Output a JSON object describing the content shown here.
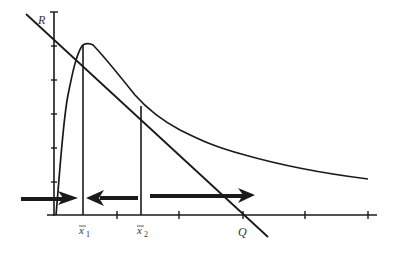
{
  "diagram": {
    "title": "",
    "axis_y_label": "R",
    "axis_x_label": "Q",
    "marker_labels": [
      {
        "base": "x",
        "sub": "1",
        "overbar": true
      },
      {
        "base": "x",
        "sub": "2",
        "overbar": true
      }
    ],
    "colors": {
      "ink": "#1a1a1a",
      "label": "#333333",
      "background": "#ffffff"
    },
    "elements": {
      "tangent_line": "straight line from R on vertical axis down through Q on horizontal axis",
      "curve": "hump-shaped curve rising steeply to a peak at x1 then decaying toward the right",
      "vertical_lines": [
        "x1",
        "x2"
      ],
      "arrows": [
        {
          "direction": "right",
          "from": "left of axis",
          "to": "x1"
        },
        {
          "direction": "left",
          "from": "x2",
          "to": "x1"
        },
        {
          "direction": "right",
          "from": "x2",
          "to": "right"
        }
      ],
      "y_ticks": 6,
      "x_ticks": 5
    }
  }
}
